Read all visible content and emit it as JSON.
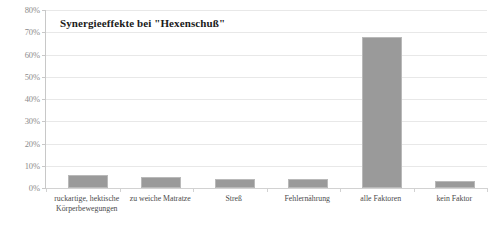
{
  "chart_data": {
    "type": "bar",
    "title": "Synergieeffekte bei \"Hexenschuß\"",
    "xlabel": "",
    "ylabel": "",
    "ylim": [
      0,
      80
    ],
    "ytick_labels": [
      "80%",
      "70%",
      "60%",
      "50%",
      "40%",
      "30%",
      "20%",
      "10%",
      "0%"
    ],
    "ytick_values": [
      80,
      70,
      60,
      50,
      40,
      30,
      20,
      10,
      0
    ],
    "grid": true,
    "legend": "none",
    "categories": [
      "ruckartige, hektische Körperbewegungen",
      "zu weiche Matratze",
      "Streß",
      "Fehlernährung",
      "alle Faktoren",
      "kein Faktor"
    ],
    "category_lines": [
      [
        "ruckartige, hektische",
        "Körperbewegungen"
      ],
      [
        "zu weiche Matratze"
      ],
      [
        "Streß"
      ],
      [
        "Fehlernährung"
      ],
      [
        "alle Faktoren"
      ],
      [
        "kein Faktor"
      ]
    ],
    "values": [
      6,
      5,
      4,
      4,
      68,
      3
    ],
    "bar_color": "#9a9a9a",
    "bar_border_color": "#b9b9b9",
    "gridline_color": "#e8e8e8",
    "axis_color": "#c8c8c8",
    "tick_label_color": "#8c8c8c",
    "title_color": "#1a1a1a",
    "background_color": "#ffffff"
  }
}
